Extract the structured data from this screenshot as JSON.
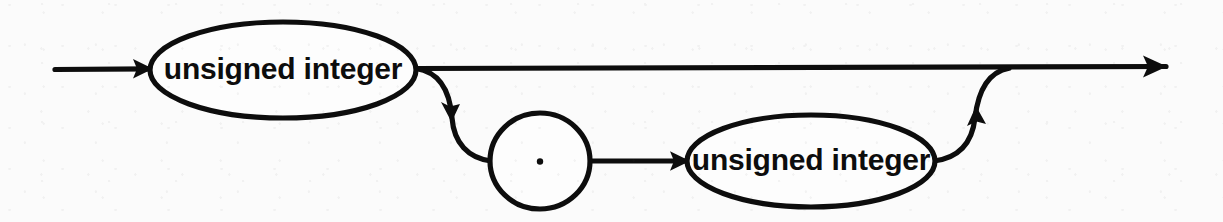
{
  "figure": {
    "kind": "railroad-syntax-diagram",
    "background_color": "#fbfbfb",
    "ink_color": "#0d0d0d",
    "width": 1223,
    "height": 222
  },
  "nodes": [
    {
      "id": "unsigned-integer-left",
      "shape": "ellipse",
      "label": "unsigned integer",
      "cx": 283,
      "cy": 70,
      "rx": 133,
      "ry": 48
    },
    {
      "id": "decimal-point",
      "shape": "circle",
      "label": ".",
      "cx": 540,
      "cy": 161,
      "rx": 50,
      "ry": 48
    },
    {
      "id": "unsigned-integer-right",
      "shape": "ellipse",
      "label": "unsigned integer",
      "cx": 811,
      "cy": 161,
      "rx": 124,
      "ry": 46
    }
  ],
  "rails": {
    "entry_line": "line from x=55 to x=150 at y=69, arrowhead into left ellipse",
    "main_bypass": "straight line from x=416 to x=1165 at y=68, arrowhead at right end",
    "branch_down": "S-curve from (416,68) down to (490,161) with arrowhead at (447,111)",
    "dot_to_integer": "line from x=590 to x=687 at y=161, arrowhead at right end",
    "branch_up": "S-curve from (935,161) up to (1008,68) with arrowhead at (981,120)"
  },
  "arrowheads": [
    {
      "name": "entry-arrow",
      "x": 152,
      "y": 69,
      "direction": "right"
    },
    {
      "name": "branch-down-arrow",
      "x": 447,
      "y": 113,
      "direction": "down"
    },
    {
      "name": "dot-exit-arrow",
      "x": 688,
      "y": 161,
      "direction": "right"
    },
    {
      "name": "branch-up-arrow",
      "x": 981,
      "y": 118,
      "direction": "up"
    },
    {
      "name": "exit-arrow",
      "x": 1165,
      "y": 67,
      "direction": "right"
    }
  ],
  "labels": {
    "node_left": "unsigned integer",
    "node_dot": ".",
    "node_right": "unsigned integer"
  }
}
